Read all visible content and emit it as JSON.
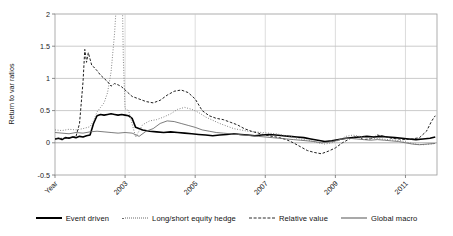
{
  "chart_data": {
    "type": "line",
    "title": "",
    "xlabel": "Year",
    "ylabel": "Return to var ratios",
    "ylim": [
      -0.5,
      2
    ],
    "xlim": [
      2001.0,
      2011.9
    ],
    "grid": true,
    "legend_position": "bottom",
    "yticks": [
      -0.5,
      0,
      0.5,
      1,
      1.5,
      2
    ],
    "ytick_labels": [
      "-0.5",
      "0",
      "0.5",
      "1",
      "1.5",
      "2"
    ],
    "xticks": [
      2001.0,
      2003,
      2005,
      2007,
      2009,
      2011
    ],
    "xtick_labels": [
      "Year",
      "2003",
      "2005",
      "2007",
      "2009",
      "2011"
    ],
    "series": [
      {
        "name": "Event driven",
        "style": "solid-thick",
        "color": "#000000",
        "x": [
          2001.0,
          2001.1,
          2001.2,
          2001.3,
          2001.4,
          2001.5,
          2001.6,
          2001.7,
          2001.8,
          2001.9,
          2002.0,
          2002.1,
          2002.2,
          2002.3,
          2002.4,
          2002.5,
          2002.6,
          2002.7,
          2002.8,
          2002.9,
          2003.0,
          2003.1,
          2003.2,
          2003.3,
          2003.5,
          2003.7,
          2003.9,
          2004.1,
          2004.3,
          2004.5,
          2004.7,
          2004.9,
          2005.1,
          2005.3,
          2005.5,
          2005.7,
          2005.9,
          2006.1,
          2006.3,
          2006.5,
          2006.7,
          2006.9,
          2007.1,
          2007.3,
          2007.5,
          2007.7,
          2007.9,
          2008.1,
          2008.3,
          2008.5,
          2008.7,
          2008.9,
          2009.1,
          2009.3,
          2009.5,
          2009.7,
          2009.9,
          2010.1,
          2010.3,
          2010.5,
          2010.7,
          2010.9,
          2011.1,
          2011.3,
          2011.5,
          2011.7,
          2011.85
        ],
        "y": [
          0.06,
          0.07,
          0.05,
          0.08,
          0.07,
          0.09,
          0.08,
          0.1,
          0.09,
          0.11,
          0.12,
          0.3,
          0.42,
          0.44,
          0.43,
          0.44,
          0.45,
          0.44,
          0.43,
          0.44,
          0.43,
          0.42,
          0.38,
          0.24,
          0.2,
          0.18,
          0.17,
          0.16,
          0.17,
          0.16,
          0.15,
          0.14,
          0.13,
          0.12,
          0.11,
          0.12,
          0.13,
          0.14,
          0.13,
          0.12,
          0.11,
          0.12,
          0.13,
          0.12,
          0.11,
          0.1,
          0.09,
          0.08,
          0.06,
          0.04,
          0.02,
          0.03,
          0.05,
          0.07,
          0.08,
          0.09,
          0.1,
          0.09,
          0.1,
          0.09,
          0.08,
          0.07,
          0.06,
          0.05,
          0.06,
          0.07,
          0.09
        ]
      },
      {
        "name": "Long/short equity hedge",
        "style": "dotted",
        "color": "#7a7a7a",
        "x": [
          2001.0,
          2001.2,
          2001.4,
          2001.6,
          2001.8,
          2002.0,
          2002.1,
          2002.2,
          2002.3,
          2002.4,
          2002.5,
          2002.6,
          2002.7,
          2002.8,
          2002.85,
          2002.9,
          2002.95,
          2003.0,
          2003.1,
          2003.3,
          2003.5,
          2003.7,
          2003.9,
          2004.1,
          2004.3,
          2004.5,
          2004.7,
          2004.9,
          2005.1,
          2005.3,
          2005.5,
          2005.7,
          2005.9,
          2006.1,
          2006.3,
          2006.5,
          2006.7,
          2006.9,
          2007.1,
          2007.3,
          2007.5,
          2007.7,
          2007.9,
          2008.1,
          2008.3,
          2008.5,
          2008.7,
          2008.9,
          2009.1,
          2009.3,
          2009.5,
          2009.7,
          2009.9,
          2010.1,
          2010.3,
          2010.5,
          2010.7,
          2010.9,
          2011.1,
          2011.3,
          2011.5,
          2011.7,
          2011.85
        ],
        "y": [
          0.2,
          0.19,
          0.21,
          0.2,
          0.22,
          0.25,
          0.34,
          0.48,
          0.55,
          0.62,
          0.78,
          1.1,
          1.7,
          2.6,
          3.3,
          3.0,
          1.3,
          0.53,
          0.5,
          0.09,
          0.28,
          0.34,
          0.36,
          0.4,
          0.45,
          0.52,
          0.55,
          0.52,
          0.47,
          0.4,
          0.35,
          0.3,
          0.26,
          0.22,
          0.2,
          0.18,
          0.17,
          0.16,
          0.15,
          0.14,
          0.12,
          0.1,
          0.07,
          0.05,
          0.03,
          0.0,
          -0.02,
          0.0,
          0.04,
          0.1,
          0.12,
          0.1,
          0.08,
          0.07,
          0.06,
          0.05,
          0.04,
          0.03,
          0.0,
          -0.02,
          -0.03,
          -0.02,
          -0.01
        ]
      },
      {
        "name": "Relative value",
        "style": "dashed",
        "color": "#1f1f1f",
        "x": [
          2001.0,
          2001.2,
          2001.4,
          2001.6,
          2001.7,
          2001.8,
          2001.85,
          2001.9,
          2001.95,
          2002.0,
          2002.05,
          2002.1,
          2002.2,
          2002.3,
          2002.4,
          2002.5,
          2002.6,
          2002.7,
          2002.8,
          2002.9,
          2003.0,
          2003.2,
          2003.4,
          2003.6,
          2003.8,
          2004.0,
          2004.2,
          2004.4,
          2004.6,
          2004.8,
          2005.0,
          2005.2,
          2005.4,
          2005.6,
          2005.8,
          2006.0,
          2006.2,
          2006.4,
          2006.6,
          2006.8,
          2007.0,
          2007.2,
          2007.4,
          2007.6,
          2007.8,
          2008.0,
          2008.2,
          2008.4,
          2008.6,
          2008.8,
          2009.0,
          2009.2,
          2009.4,
          2009.6,
          2009.8,
          2010.0,
          2010.2,
          2010.4,
          2010.6,
          2010.8,
          2011.0,
          2011.2,
          2011.4,
          2011.6,
          2011.75,
          2011.85
        ],
        "y": [
          0.06,
          0.07,
          0.08,
          0.1,
          0.3,
          0.95,
          1.45,
          1.25,
          1.4,
          1.3,
          1.2,
          1.18,
          1.12,
          1.05,
          1.0,
          0.95,
          0.88,
          0.92,
          0.9,
          0.87,
          0.82,
          0.72,
          0.68,
          0.64,
          0.62,
          0.66,
          0.74,
          0.8,
          0.82,
          0.78,
          0.68,
          0.5,
          0.42,
          0.38,
          0.36,
          0.32,
          0.28,
          0.22,
          0.18,
          0.15,
          0.12,
          0.1,
          0.08,
          0.05,
          0.0,
          -0.06,
          -0.12,
          -0.15,
          -0.17,
          -0.13,
          -0.08,
          0.0,
          0.06,
          0.1,
          0.05,
          0.06,
          0.12,
          0.1,
          0.07,
          0.06,
          0.05,
          0.06,
          0.08,
          0.18,
          0.34,
          0.42
        ]
      },
      {
        "name": "Global macro",
        "style": "solid-thin",
        "color": "#6e6e6e",
        "x": [
          2001.0,
          2001.2,
          2001.4,
          2001.6,
          2001.8,
          2002.0,
          2002.2,
          2002.4,
          2002.6,
          2002.8,
          2003.0,
          2003.2,
          2003.4,
          2003.6,
          2003.8,
          2004.0,
          2004.2,
          2004.4,
          2004.6,
          2004.8,
          2005.0,
          2005.2,
          2005.4,
          2005.6,
          2005.8,
          2006.0,
          2006.2,
          2006.4,
          2006.6,
          2006.8,
          2007.0,
          2007.2,
          2007.4,
          2007.6,
          2007.8,
          2008.0,
          2008.2,
          2008.4,
          2008.6,
          2008.8,
          2009.0,
          2009.2,
          2009.4,
          2009.6,
          2009.8,
          2010.0,
          2010.2,
          2010.4,
          2010.6,
          2010.8,
          2011.0,
          2011.2,
          2011.4,
          2011.6,
          2011.85
        ],
        "y": [
          0.16,
          0.15,
          0.14,
          0.16,
          0.15,
          0.17,
          0.18,
          0.17,
          0.16,
          0.15,
          0.16,
          0.15,
          0.1,
          0.18,
          0.22,
          0.3,
          0.34,
          0.33,
          0.3,
          0.27,
          0.24,
          0.2,
          0.18,
          0.16,
          0.15,
          0.14,
          0.13,
          0.12,
          0.11,
          0.1,
          0.09,
          0.08,
          0.07,
          0.06,
          0.05,
          0.04,
          0.03,
          0.02,
          0.0,
          0.01,
          0.03,
          0.06,
          0.07,
          0.06,
          0.05,
          0.04,
          0.05,
          0.04,
          0.03,
          0.02,
          0.0,
          -0.02,
          -0.03,
          -0.02,
          -0.01
        ]
      }
    ]
  },
  "legend": {
    "items": [
      {
        "label": "Event driven",
        "style": "solid-thick"
      },
      {
        "label": "Long/short equity hedge",
        "style": "dotted"
      },
      {
        "label": "Relative value",
        "style": "dashed"
      },
      {
        "label": "Global macro",
        "style": "solid-thin"
      }
    ]
  }
}
